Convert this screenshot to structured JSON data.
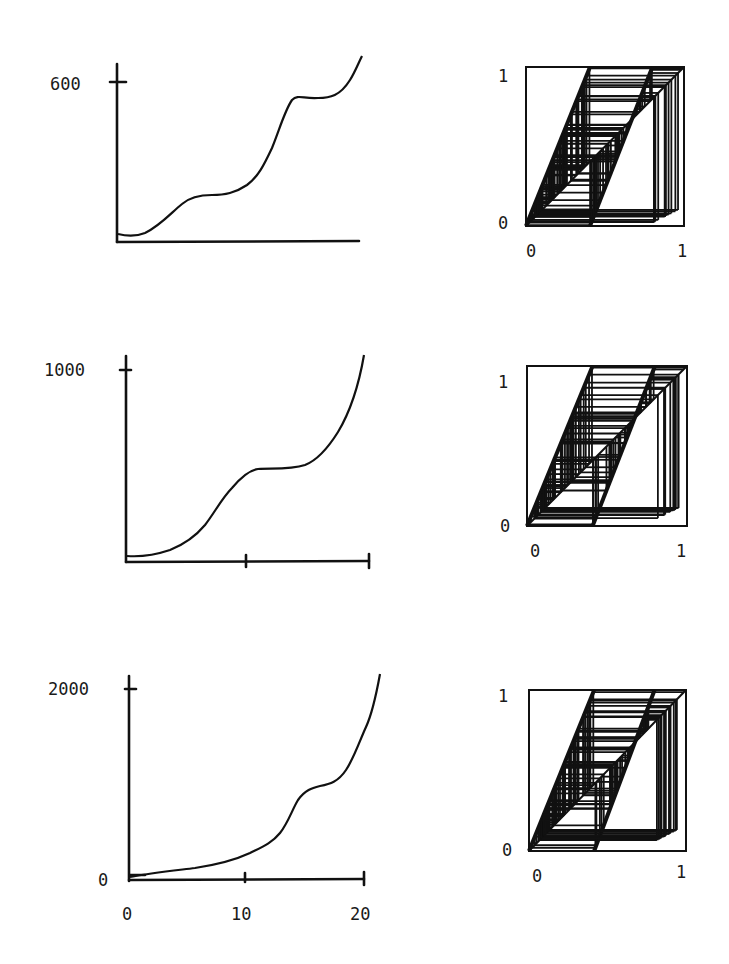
{
  "chart_data": [
    {
      "type": "line",
      "panel": "row1-left",
      "title": "",
      "xlabel": "",
      "ylabel": "",
      "xlim": [
        0,
        20
      ],
      "ylim": [
        0,
        700
      ],
      "y_ticks": [
        {
          "value": 600,
          "label": "600"
        }
      ],
      "x_ticks": [],
      "grid": false,
      "x": [
        0,
        1,
        2,
        3,
        4,
        5,
        6,
        7,
        8,
        9,
        10,
        11,
        12,
        13,
        14,
        15,
        16,
        17,
        18,
        19,
        20
      ],
      "y": [
        20,
        15,
        25,
        60,
        110,
        155,
        175,
        178,
        180,
        200,
        250,
        340,
        460,
        540,
        555,
        560,
        565,
        590,
        630,
        700,
        720
      ]
    },
    {
      "type": "cobweb",
      "panel": "row1-right",
      "xlim": [
        0,
        1
      ],
      "ylim": [
        0,
        1
      ],
      "x_ticks": [
        {
          "value": 0,
          "label": "0"
        },
        {
          "value": 1,
          "label": "1"
        }
      ],
      "y_ticks": [
        {
          "value": 0,
          "label": "0"
        },
        {
          "value": 1,
          "label": "1"
        }
      ],
      "description": "Cobweb iteration plot of a piecewise-linear map on the unit square; dense horizontal/vertical segments between the diagonal and two parallel map branches"
    },
    {
      "type": "line",
      "panel": "row2-left",
      "title": "",
      "xlabel": "",
      "ylabel": "",
      "xlim": [
        0,
        20
      ],
      "ylim": [
        0,
        1000
      ],
      "y_ticks": [
        {
          "value": 1000,
          "label": "1000"
        }
      ],
      "x_ticks": [
        {
          "value": 10,
          "label": ""
        },
        {
          "value": 20,
          "label": ""
        }
      ],
      "grid": false,
      "x": [
        0,
        1,
        2,
        3,
        4,
        5,
        6,
        7,
        8,
        9,
        10,
        11,
        12,
        13,
        14,
        15,
        16,
        17,
        18,
        19,
        20
      ],
      "y": [
        10,
        15,
        30,
        55,
        95,
        160,
        270,
        390,
        470,
        495,
        495,
        495,
        500,
        530,
        600,
        700,
        820,
        960,
        1080,
        1150,
        1160
      ]
    },
    {
      "type": "cobweb",
      "panel": "row2-right",
      "xlim": [
        0,
        1
      ],
      "ylim": [
        0,
        1
      ],
      "x_ticks": [
        {
          "value": 0,
          "label": "0"
        },
        {
          "value": 1,
          "label": "1"
        }
      ],
      "y_ticks": [
        {
          "value": 0,
          "label": "0"
        },
        {
          "value": 1,
          "label": "1"
        }
      ],
      "description": "Cobweb iteration plot of a piecewise-linear map on the unit square"
    },
    {
      "type": "line",
      "panel": "row3-left",
      "title": "",
      "xlabel": "",
      "ylabel": "",
      "xlim": [
        0,
        21
      ],
      "ylim": [
        0,
        2200
      ],
      "y_ticks": [
        {
          "value": 0,
          "label": "0"
        },
        {
          "value": 2000,
          "label": "2000"
        }
      ],
      "x_ticks": [
        {
          "value": 0,
          "label": "0"
        },
        {
          "value": 10,
          "label": "10"
        },
        {
          "value": 20,
          "label": "20"
        }
      ],
      "grid": false,
      "x": [
        0,
        1,
        2,
        3,
        4,
        5,
        6,
        7,
        8,
        9,
        10,
        11,
        12,
        13,
        14,
        15,
        16,
        17,
        18,
        19,
        20,
        21
      ],
      "y": [
        20,
        40,
        60,
        75,
        90,
        105,
        125,
        150,
        180,
        210,
        260,
        330,
        400,
        530,
        790,
        920,
        960,
        990,
        1060,
        1180,
        1550,
        2250
      ]
    },
    {
      "type": "cobweb",
      "panel": "row3-right",
      "xlim": [
        0,
        1
      ],
      "ylim": [
        0,
        1
      ],
      "x_ticks": [
        {
          "value": 0,
          "label": "0"
        },
        {
          "value": 1,
          "label": "1"
        }
      ],
      "y_ticks": [
        {
          "value": 0,
          "label": "0"
        },
        {
          "value": 1,
          "label": "1"
        }
      ],
      "description": "Cobweb iteration plot of a piecewise-linear map on the unit square"
    }
  ],
  "labels": {
    "p1_y600": "600",
    "p2_y1000": "1000",
    "p3_y2000": "2000",
    "p3_y0": "0",
    "p3_x0": "0",
    "p3_x10": "10",
    "p3_x20": "20",
    "c_zero": "0",
    "c_one": "1"
  }
}
